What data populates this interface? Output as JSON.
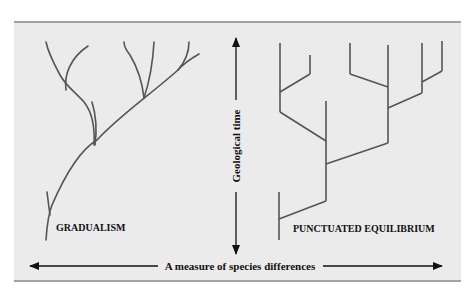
{
  "diagram": {
    "left_model": {
      "label": "GRADUALISM"
    },
    "right_model": {
      "label": "PUNCTUATED EQUILIBRIUM"
    },
    "vertical_axis": {
      "label": "Geological time",
      "direction": "both"
    },
    "horizontal_axis": {
      "label": "A measure of species differences",
      "direction": "both"
    },
    "colors": {
      "panel_background": "#ebebeb",
      "panel_border": "#a3a3a3",
      "branch_line": "#555555",
      "arrow": "#111111"
    }
  }
}
